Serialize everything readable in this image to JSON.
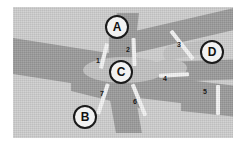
{
  "image": {
    "title": "Road junction schematic",
    "width": 246,
    "height": 145,
    "background_color": "#ffffff",
    "field_color": "#cfcfcf",
    "road_color": "#9b9b9b",
    "junction_color": "#c2c2c2",
    "marker_color": "#f4f4f4",
    "label_color": "#1a1a1a"
  },
  "junctions": [
    {
      "id": "A",
      "label": "A",
      "x": 117,
      "y": 27
    },
    {
      "id": "B",
      "label": "B",
      "x": 85,
      "y": 117
    },
    {
      "id": "C",
      "label": "C",
      "x": 121,
      "y": 72
    },
    {
      "id": "D",
      "label": "D",
      "x": 212,
      "y": 52
    }
  ],
  "markers": [
    {
      "id": "1",
      "label": "1",
      "label_x": 96,
      "label_y": 57
    },
    {
      "id": "2",
      "label": "2",
      "label_x": 126,
      "label_y": 46
    },
    {
      "id": "3",
      "label": "3",
      "label_x": 177,
      "label_y": 41
    },
    {
      "id": "4",
      "label": "4",
      "label_x": 163,
      "label_y": 75
    },
    {
      "id": "5",
      "label": "5",
      "label_x": 203,
      "label_y": 88
    },
    {
      "id": "6",
      "label": "6",
      "label_x": 133,
      "label_y": 98
    },
    {
      "id": "7",
      "label": "7",
      "label_x": 100,
      "label_y": 90
    }
  ],
  "watermarks": [
    {
      "id": "left",
      "text": "·",
      "x": 22,
      "y": 69
    },
    {
      "id": "right",
      "text": "·",
      "x": 198,
      "y": 20
    }
  ]
}
